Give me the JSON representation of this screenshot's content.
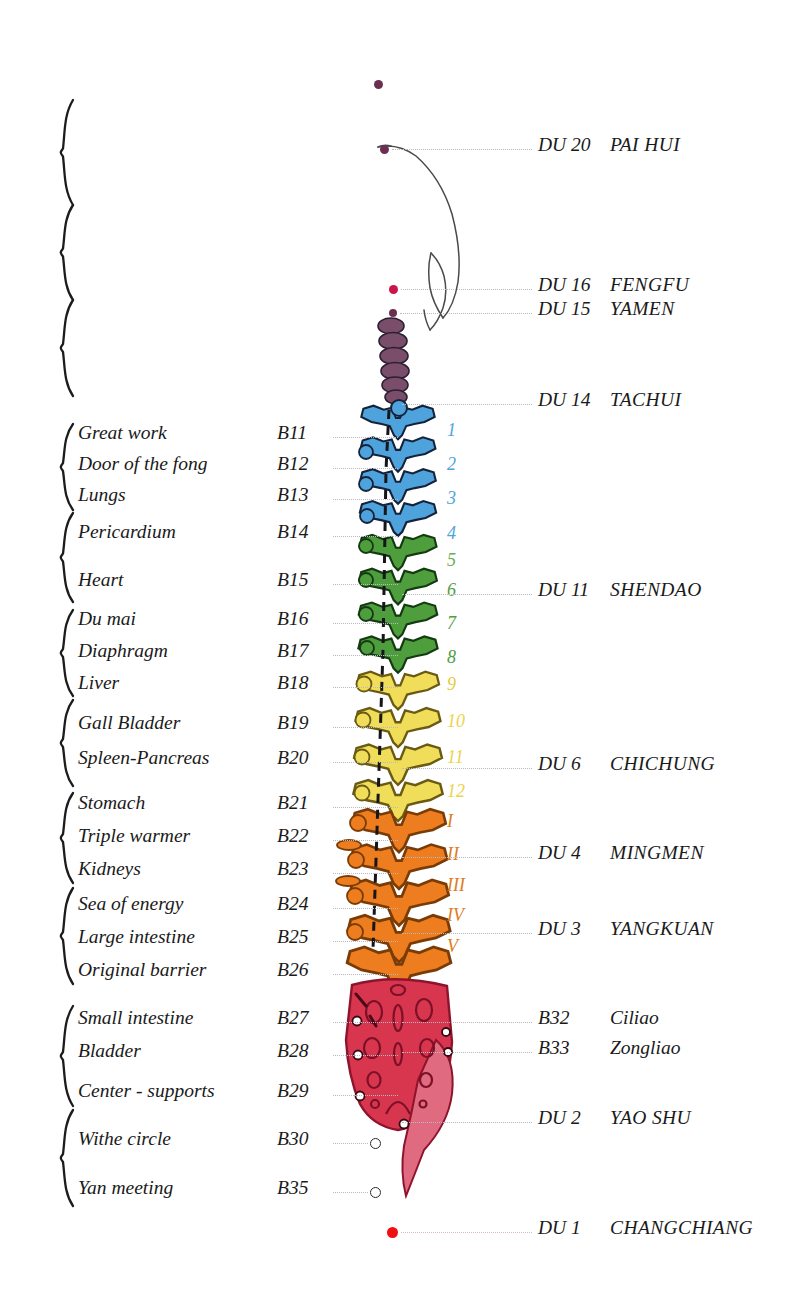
{
  "left_rows": [
    {
      "organ": "Great work",
      "code": "B11",
      "y": 437
    },
    {
      "organ": "Door of the fong",
      "code": "B12",
      "y": 468
    },
    {
      "organ": "Lungs",
      "code": "B13",
      "y": 499
    },
    {
      "organ": "Pericardium",
      "code": "B14",
      "y": 536
    },
    {
      "organ": "Heart",
      "code": "B15",
      "y": 584
    },
    {
      "organ": "Du mai",
      "code": "B16",
      "y": 623
    },
    {
      "organ": "Diaphragm",
      "code": "B17",
      "y": 655
    },
    {
      "organ": "Liver",
      "code": "B18",
      "y": 687
    },
    {
      "organ": "Gall Bladder",
      "code": "B19",
      "y": 727
    },
    {
      "organ": "Spleen-Pancreas",
      "code": "B20",
      "y": 762
    },
    {
      "organ": "Stomach",
      "code": "B21",
      "y": 807
    },
    {
      "organ": "Triple warmer",
      "code": "B22",
      "y": 840
    },
    {
      "organ": "Kidneys",
      "code": "B23",
      "y": 873
    },
    {
      "organ": "Sea of energy",
      "code": "B24",
      "y": 908
    },
    {
      "organ": "Large intestine",
      "code": "B25",
      "y": 941
    },
    {
      "organ": "Original barrier",
      "code": "B26",
      "y": 974
    },
    {
      "organ": "Small intestine",
      "code": "B27",
      "y": 1022
    },
    {
      "organ": "Bladder",
      "code": "B28",
      "y": 1055
    },
    {
      "organ": "Center - supports",
      "code": "B29",
      "y": 1095
    },
    {
      "organ": "Withe circle",
      "code": "B30",
      "y": 1143,
      "marker": "open-circle"
    },
    {
      "organ": "Yan meeting",
      "code": "B35",
      "y": 1192,
      "marker": "open-circle"
    }
  ],
  "right_rows": [
    {
      "code": "DU 20",
      "name": "PAI HUI",
      "y": 149,
      "dot": "#6b2f52",
      "dot_x": 380,
      "dot_size": 9
    },
    {
      "code": "DU 16",
      "name": "FENGFU",
      "y": 289,
      "dot": "#cc1448",
      "dot_x": 389,
      "dot_size": 9
    },
    {
      "code": "DU 15",
      "name": "YAMEN",
      "y": 313,
      "dot": "#6b2f52",
      "dot_x": 389,
      "dot_size": 8
    },
    {
      "code": "DU 14",
      "name": "TACHUI",
      "y": 404,
      "dot": null
    },
    {
      "code": "DU 11",
      "name": "SHENDAO",
      "y": 594,
      "dot": null
    },
    {
      "code": "DU 6",
      "name": "CHICHUNG",
      "y": 768,
      "dot": null
    },
    {
      "code": "DU 4",
      "name": "MINGMEN",
      "y": 857,
      "dot": null
    },
    {
      "code": "DU 3",
      "name": "YANGKUAN",
      "y": 933,
      "dot": null
    },
    {
      "code": "B32",
      "name": "Ciliao",
      "y": 1022,
      "style": "mixed"
    },
    {
      "code": "B33",
      "name": "Zongliao",
      "y": 1052,
      "style": "mixed"
    },
    {
      "code": "DU 2",
      "name": "YAO SHU",
      "y": 1122,
      "dot": null
    },
    {
      "code": "DU 1",
      "name": "CHANGCHIANG",
      "y": 1232,
      "dot": "#ee1111",
      "dot_x": 387,
      "dot_size": 11
    }
  ],
  "vertebra_numbers": [
    {
      "label": "1",
      "y": 432,
      "color": "#4ea3dd"
    },
    {
      "label": "2",
      "y": 466,
      "color": "#4ea3dd"
    },
    {
      "label": "3",
      "y": 500,
      "color": "#4ea3dd"
    },
    {
      "label": "4",
      "y": 535,
      "color": "#4ea3dd"
    },
    {
      "label": "5",
      "y": 562,
      "color": "#6aab54"
    },
    {
      "label": "6",
      "y": 592,
      "color": "#4f9e3e"
    },
    {
      "label": "7",
      "y": 625,
      "color": "#4f9e3e"
    },
    {
      "label": "8",
      "y": 659,
      "color": "#4f9e3e"
    },
    {
      "label": "9",
      "y": 686,
      "color": "#e8c93c"
    },
    {
      "label": "10",
      "y": 723,
      "color": "#edd24a"
    },
    {
      "label": "11",
      "y": 759,
      "color": "#edd24a"
    },
    {
      "label": "12",
      "y": 793,
      "color": "#edd24a"
    },
    {
      "label": "I",
      "y": 823,
      "color": "#e07b20"
    },
    {
      "label": "II",
      "y": 856,
      "color": "#e07b20"
    },
    {
      "label": "III",
      "y": 887,
      "color": "#e07b20"
    },
    {
      "label": "IV",
      "y": 917,
      "color": "#e07b20"
    },
    {
      "label": "V",
      "y": 948,
      "color": "#e07b20"
    }
  ],
  "braces": [
    {
      "y": 100,
      "h": 105
    },
    {
      "y": 205,
      "h": 95
    },
    {
      "y": 300,
      "h": 96
    },
    {
      "y": 424,
      "h": 86
    },
    {
      "y": 513,
      "h": 89
    },
    {
      "y": 610,
      "h": 86
    },
    {
      "y": 700,
      "h": 86
    },
    {
      "y": 793,
      "h": 90
    },
    {
      "y": 888,
      "h": 96
    },
    {
      "y": 1006,
      "h": 100
    },
    {
      "y": 1110,
      "h": 96
    }
  ],
  "colors": {
    "cervical": "#7a4d6b",
    "thoracic_upper": "#4ea3dd",
    "thoracic_mid": "#4f9e3e",
    "thoracic_lower": "#f0de5a",
    "lumbar": "#ed7d1e",
    "sacrum": "#d8354f",
    "outline": "#1b1b1b",
    "leader": "#b9b9c4"
  }
}
